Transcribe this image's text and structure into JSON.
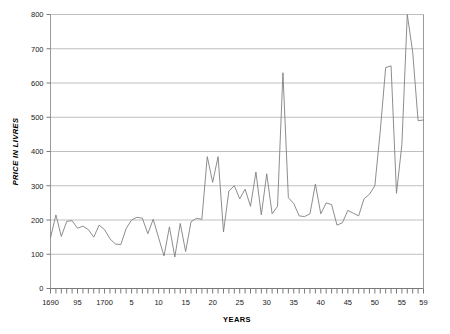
{
  "chart_data": {
    "type": "line",
    "title": "",
    "xlabel": "YEARS",
    "ylabel": "PRICE IN LIVRES",
    "xlim": [
      1690,
      1759
    ],
    "ylim": [
      0,
      800
    ],
    "ytick_step": 100,
    "xtick_step": 1,
    "xlabel_step": 5,
    "grid": true,
    "legend": null,
    "line_color": "#808080",
    "grid_color": "#bfbfbf",
    "axis_color": "#808080",
    "yticks": [
      0,
      100,
      200,
      300,
      400,
      500,
      600,
      700,
      800
    ],
    "ytick_labels": [
      "0",
      "100",
      "200",
      "300",
      "400",
      "500",
      "600",
      "700",
      "800"
    ],
    "xtick_labels": [
      {
        "x": 1690,
        "label": "1690"
      },
      {
        "x": 1695,
        "label": "95"
      },
      {
        "x": 1700,
        "label": "1700"
      },
      {
        "x": 1705,
        "label": "5"
      },
      {
        "x": 1710,
        "label": "10"
      },
      {
        "x": 1715,
        "label": "15"
      },
      {
        "x": 1720,
        "label": "20"
      },
      {
        "x": 1725,
        "label": "25"
      },
      {
        "x": 1730,
        "label": "30"
      },
      {
        "x": 1735,
        "label": "35"
      },
      {
        "x": 1740,
        "label": "40"
      },
      {
        "x": 1745,
        "label": "45"
      },
      {
        "x": 1750,
        "label": "50"
      },
      {
        "x": 1755,
        "label": "55"
      },
      {
        "x": 1759,
        "label": "59"
      }
    ],
    "x": [
      1690,
      1691,
      1692,
      1693,
      1694,
      1695,
      1696,
      1697,
      1698,
      1699,
      1700,
      1701,
      1702,
      1703,
      1704,
      1705,
      1706,
      1707,
      1708,
      1709,
      1710,
      1711,
      1712,
      1713,
      1714,
      1715,
      1716,
      1717,
      1718,
      1719,
      1720,
      1721,
      1722,
      1723,
      1724,
      1725,
      1726,
      1727,
      1728,
      1729,
      1730,
      1731,
      1732,
      1733,
      1734,
      1735,
      1736,
      1737,
      1738,
      1739,
      1740,
      1741,
      1742,
      1743,
      1744,
      1745,
      1746,
      1747,
      1748,
      1749,
      1750,
      1751,
      1752,
      1753,
      1754,
      1755,
      1756,
      1757,
      1758,
      1759
    ],
    "values": [
      148,
      215,
      152,
      196,
      198,
      176,
      182,
      172,
      150,
      185,
      172,
      145,
      130,
      128,
      175,
      200,
      208,
      205,
      160,
      202,
      148,
      95,
      180,
      92,
      190,
      108,
      195,
      205,
      202,
      385,
      310,
      385,
      165,
      285,
      300,
      262,
      290,
      240,
      340,
      215,
      335,
      218,
      240,
      630,
      265,
      248,
      212,
      210,
      218,
      305,
      218,
      250,
      245,
      185,
      192,
      228,
      220,
      212,
      262,
      275,
      300,
      460,
      645,
      650,
      278,
      420,
      800,
      690,
      490,
      492
    ],
    "series_name": "Price in livres"
  },
  "labels": {
    "y_axis_title": "PRICE IN LIVRES",
    "x_axis_title": "YEARS"
  }
}
